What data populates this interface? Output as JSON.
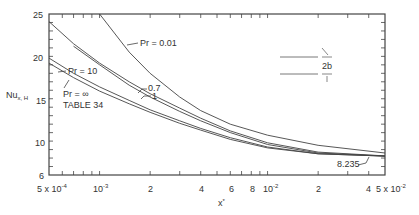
{
  "chart_data": {
    "type": "line",
    "title": "",
    "xlabel": "x*",
    "ylabel": "Nu x,H",
    "xscale": "log",
    "xlim": [
      0.0005,
      0.05
    ],
    "ylim": [
      6,
      25
    ],
    "x_tick_labels": [
      "5x10^-4",
      "10^-3",
      "2",
      "4",
      "6",
      "8",
      "10^-2",
      "2",
      "4",
      "5x10^-2"
    ],
    "y_tick_labels": [
      "6",
      "10",
      "15",
      "20",
      "25"
    ],
    "grid": false,
    "annotations": [
      "Pr = 0.01",
      "Pr = 10",
      "Pr = ∞",
      "TABLE 34",
      "0.7",
      "1",
      "2b",
      "8.235"
    ],
    "asymptote": 8.235,
    "series": [
      {
        "name": "Pr = 0.01",
        "x": [
          0.001,
          0.0015,
          0.002,
          0.003,
          0.004,
          0.006,
          0.01,
          0.02,
          0.05
        ],
        "y": [
          25.0,
          20.5,
          18.0,
          15.2,
          13.6,
          12.0,
          10.7,
          9.5,
          8.6
        ]
      },
      {
        "name": "Pr = 0.7",
        "x": [
          0.0005,
          0.0007,
          0.001,
          0.0015,
          0.002,
          0.003,
          0.004,
          0.006,
          0.01,
          0.02,
          0.05
        ],
        "y": [
          24.1,
          21.5,
          19.2,
          17.0,
          15.6,
          13.9,
          12.7,
          11.2,
          9.8,
          8.7,
          8.25
        ]
      },
      {
        "name": "Pr = 1",
        "x": [
          0.0007,
          0.001,
          0.0015,
          0.002,
          0.003,
          0.004,
          0.006,
          0.01,
          0.02,
          0.05
        ],
        "y": [
          21.2,
          19.0,
          16.6,
          15.2,
          13.5,
          12.4,
          11.0,
          9.6,
          8.6,
          8.24
        ]
      },
      {
        "name": "Pr = 10",
        "x": [
          0.0005,
          0.0007,
          0.001,
          0.0015,
          0.002,
          0.003,
          0.004,
          0.006,
          0.01,
          0.02,
          0.05
        ],
        "y": [
          19.8,
          18.0,
          16.4,
          14.8,
          13.7,
          12.4,
          11.5,
          10.4,
          9.3,
          8.5,
          8.235
        ]
      },
      {
        "name": "Pr = ∞ (TABLE 34)",
        "x": [
          0.0005,
          0.0007,
          0.001,
          0.0015,
          0.002,
          0.003,
          0.004,
          0.006,
          0.01,
          0.02,
          0.05
        ],
        "y": [
          19.2,
          17.5,
          15.9,
          14.4,
          13.4,
          12.1,
          11.3,
          10.2,
          9.2,
          8.5,
          8.235
        ]
      }
    ]
  }
}
